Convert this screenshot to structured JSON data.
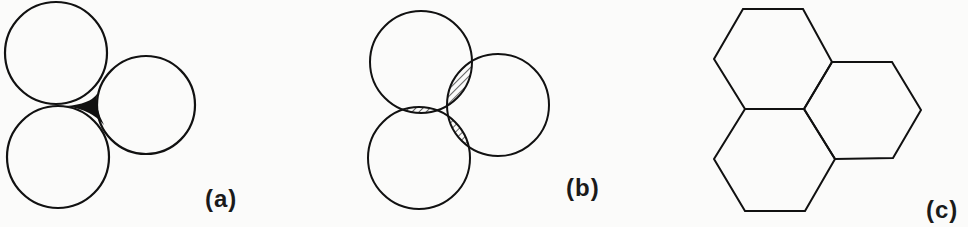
{
  "panels": [
    {
      "id": "a",
      "label": "(a)",
      "description": "Three tangent circles with filled interstitial void"
    },
    {
      "id": "b",
      "label": "(b)",
      "description": "Three overlapping circles with hatched lens-shaped overlaps"
    },
    {
      "id": "c",
      "label": "(c)",
      "description": "Three hexagons tiling without gaps or overlaps"
    }
  ],
  "colors": {
    "stroke": "#111111",
    "background": "#fbfbfa",
    "fill_void": "#111111"
  }
}
